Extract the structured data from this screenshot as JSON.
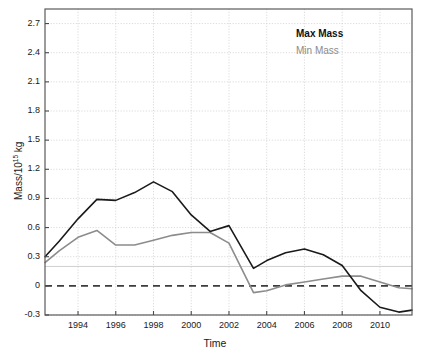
{
  "chart_data": {
    "type": "line",
    "title": "",
    "xlabel": "Time",
    "ylabel": "Mass/10^15 kg",
    "ylabel_prefix": "Mass/10",
    "ylabel_exponent": "15",
    "ylabel_suffix": " kg",
    "xlim": [
      1992.25,
      2011.7
    ],
    "ylim": [
      -0.3,
      2.85
    ],
    "xticks": [
      1994,
      1996,
      1998,
      2000,
      2002,
      2004,
      2006,
      2008,
      2010
    ],
    "xtick_labels": [
      "1994",
      "1996",
      "1998",
      "2000",
      "2002",
      "2004",
      "2006",
      "2008",
      "2010"
    ],
    "yticks": [
      -0.3,
      0,
      0.3,
      0.6,
      0.9,
      1.2,
      1.5,
      1.8,
      2.1,
      2.4,
      2.7
    ],
    "ytick_labels": [
      "-0.3",
      "0",
      "0.3",
      "0.6",
      "0.9",
      "1.2",
      "1.5",
      "1.8",
      "2.1",
      "2.4",
      "2.7"
    ],
    "grid": true,
    "legend_position": "top-right",
    "reference_lines": [
      {
        "name": "zero-line",
        "y": 0,
        "style": "dashed",
        "color": "#3d3d3d"
      },
      {
        "name": "threshold-line",
        "y": 0.2,
        "style": "solid",
        "color": "#c9c9c9"
      }
    ],
    "series": [
      {
        "name": "Max Mass",
        "color": "#1a1a1a",
        "x": [
          1992.25,
          1993,
          1994,
          1995,
          1996,
          1997,
          1998,
          1999,
          2000,
          2001,
          2002,
          2003.3,
          2004,
          2005,
          2006,
          2007,
          2008,
          2009,
          2010,
          2011,
          2011.7
        ],
        "values": [
          0.3,
          0.46,
          0.69,
          0.89,
          0.88,
          0.96,
          1.07,
          0.97,
          0.73,
          0.56,
          0.62,
          0.18,
          0.26,
          0.34,
          0.38,
          0.32,
          0.21,
          -0.05,
          -0.22,
          -0.27,
          -0.25
        ]
      },
      {
        "name": "Min Mass",
        "color": "#8c8c8c",
        "x": [
          1992.25,
          1993,
          1994,
          1995,
          1996,
          1997,
          1998,
          1999,
          2000,
          2001,
          2002,
          2003.3,
          2004,
          2005,
          2006,
          2007,
          2008,
          2009,
          2010,
          2011,
          2011.7
        ],
        "values": [
          0.24,
          0.36,
          0.5,
          0.57,
          0.42,
          0.42,
          0.47,
          0.52,
          0.55,
          0.55,
          0.44,
          -0.07,
          -0.05,
          0.01,
          0.04,
          0.07,
          0.1,
          0.1,
          0.04,
          -0.02,
          -0.03
        ]
      }
    ]
  },
  "legend": {
    "max_label": "Max Mass",
    "min_label": "Min Mass"
  }
}
